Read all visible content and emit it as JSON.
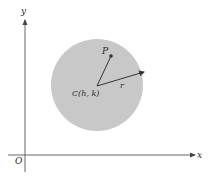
{
  "diagram": {
    "type": "circle-on-coordinate-axes",
    "axes": {
      "x_label": "x",
      "y_label": "y",
      "origin_label": "O",
      "axis_color": "#555555"
    },
    "circle": {
      "fill_color": "#c8c8c8",
      "center_label": "C(h, k)",
      "radius_label": "r"
    },
    "point": {
      "label": "P"
    },
    "vector_color": "#333333"
  }
}
